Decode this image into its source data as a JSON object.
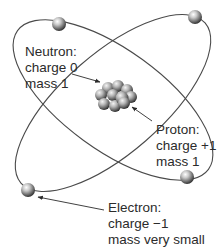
{
  "diagram": {
    "colors": {
      "background": "#ffffff",
      "orbit": "#4a4a4a",
      "text": "#2b2b2b",
      "particle_light": "#f2f2f2",
      "particle_dark": "#3a3a3a"
    },
    "labels": {
      "neutron": {
        "name": "Neutron:",
        "charge": "charge 0",
        "mass": "mass 1"
      },
      "proton": {
        "name": "Proton:",
        "charge": "charge +1",
        "mass": "mass 1"
      },
      "electron": {
        "name": "Electron:",
        "charge": "charge −1",
        "mass": "mass very small"
      }
    },
    "orbits": [
      {
        "name": "orbit-a",
        "cx": 113,
        "cy": 100,
        "rx": 118,
        "ry": 50,
        "rotate": 36
      },
      {
        "name": "orbit-b",
        "cx": 113,
        "cy": 103,
        "rx": 122,
        "ry": 50,
        "rotate": -41
      }
    ],
    "electrons": [
      {
        "x": 59,
        "y": 24
      },
      {
        "x": 195,
        "y": 17
      },
      {
        "x": 187,
        "y": 177
      },
      {
        "x": 28,
        "y": 190
      }
    ]
  }
}
